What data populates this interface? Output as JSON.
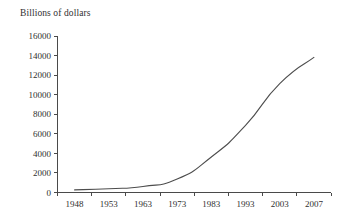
{
  "chart_data": {
    "type": "line",
    "title": "Billions of dollars",
    "xlabel": "",
    "ylabel": "Billions of dollars",
    "grid": false,
    "legend": "none",
    "ylim": [
      0,
      16000
    ],
    "yticks": [
      0,
      2000,
      4000,
      6000,
      8000,
      10000,
      12000,
      14000,
      16000
    ],
    "ytick_labels": [
      "0",
      "2000",
      "4000",
      "6000",
      "8000",
      "10000",
      "12000",
      "14000",
      "16000"
    ],
    "xtick_labels": [
      "1948",
      "1953",
      "1963",
      "1973",
      "1983",
      "1993",
      "2003",
      "2007"
    ],
    "x": [
      1948,
      1953,
      1963,
      1973,
      1983,
      1993,
      2003,
      2007
    ],
    "values": [
      270,
      390,
      620,
      1380,
      3630,
      6860,
      11140,
      13810
    ],
    "series": [
      {
        "name": "Billions of dollars",
        "color": "#4d4d4d",
        "points": [
          {
            "x": "1948",
            "y": 270
          },
          {
            "x": "1953",
            "y": 390
          },
          {
            "x": "1963",
            "y": 620
          },
          {
            "x": "1973",
            "y": 1380
          },
          {
            "x": "1983",
            "y": 3630
          },
          {
            "x": "1993",
            "y": 6860
          },
          {
            "x": "2003",
            "y": 11140
          },
          {
            "x": "2007",
            "y": 13810
          }
        ]
      }
    ]
  },
  "colors": {
    "background": "#ffffff",
    "axis": "#4a4a4a",
    "text": "#2f2f2f",
    "line": "#4d4d4d"
  }
}
